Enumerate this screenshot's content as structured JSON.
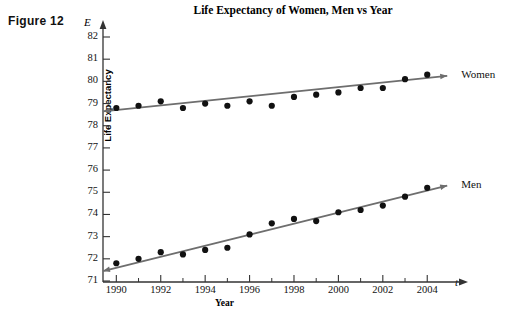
{
  "figure": {
    "label": "Figure 12"
  },
  "chart_data": {
    "type": "scatter",
    "title": "Life Expectancy of Women, Men vs Year",
    "xlabel": "Year",
    "ylabel": "Life Expectancy",
    "x_axis_symbol": "t",
    "y_axis_symbol": "E",
    "grid": false,
    "legend_position": "right-inline-arrow-labels",
    "xlim": [
      1989.4,
      2004.8
    ],
    "ylim": [
      71,
      82.4
    ],
    "x_tick_labels": [
      "1990",
      "1992",
      "1994",
      "1996",
      "1998",
      "2000",
      "2002",
      "2004"
    ],
    "x_tick_values": [
      1990,
      1992,
      1994,
      1996,
      1998,
      2000,
      2002,
      2004
    ],
    "x_minor_ticks": [
      1991,
      1993,
      1995,
      1997,
      1999,
      2001,
      2003
    ],
    "y_tick_labels": [
      "71",
      "72",
      "73",
      "74",
      "75",
      "76",
      "77",
      "78",
      "79",
      "80",
      "81",
      "82"
    ],
    "y_tick_values": [
      71,
      72,
      73,
      74,
      75,
      76,
      77,
      78,
      79,
      80,
      81,
      82
    ],
    "x": [
      1990,
      1991,
      1992,
      1993,
      1994,
      1995,
      1996,
      1997,
      1998,
      1999,
      2000,
      2001,
      2002,
      2003,
      2004
    ],
    "series": [
      {
        "name": "Women",
        "label": "Women",
        "color": "#111111",
        "trend_color": "#6e6e6e",
        "values": [
          78.8,
          78.9,
          79.1,
          78.8,
          79.0,
          78.9,
          79.1,
          78.9,
          79.3,
          79.4,
          79.5,
          79.7,
          79.7,
          80.1,
          80.3
        ],
        "trend_start": [
          1989.4,
          78.65
        ],
        "trend_end": [
          2004.9,
          80.25
        ]
      },
      {
        "name": "Men",
        "label": "Men",
        "color": "#111111",
        "trend_color": "#6e6e6e",
        "values": [
          71.8,
          72.0,
          72.3,
          72.2,
          72.4,
          72.5,
          73.1,
          73.6,
          73.8,
          73.7,
          74.1,
          74.2,
          74.4,
          74.8,
          75.2
        ],
        "trend_start": [
          1989.4,
          71.45
        ],
        "trend_end": [
          2004.9,
          75.3
        ]
      }
    ]
  }
}
